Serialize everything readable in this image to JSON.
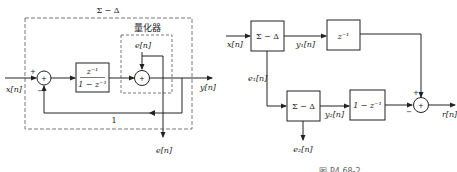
{
  "left_diagram": {
    "outer_block_label": "Σ − Δ",
    "quantizer_label": "量化器",
    "input_label": "x[n]",
    "output_label": "y[n]",
    "error_input_label": "e[n]",
    "error_output_label": "e[n]",
    "feedback_gain": "1",
    "sum1_plus": "+",
    "sum1_minus": "−",
    "sum_symbol": "+",
    "integrator": {
      "numerator": "z⁻¹",
      "denominator": "1 − z⁻¹"
    }
  },
  "right_diagram": {
    "input_label": "x[n]",
    "sd1_label": "Σ − Δ",
    "sd2_label": "Σ − Δ",
    "delay_label": "z⁻¹",
    "diff_label": "1 − z⁻¹",
    "y1_label": "y₁[n]",
    "y2_label": "y₂[n]",
    "e1_label": "e₁[n]",
    "e2_label": "e₂[n]",
    "output_label": "r[n]",
    "sum_plus": "+",
    "sum_minus": "−",
    "sum_symbol": "+",
    "caption": "图 P4.68-2"
  }
}
